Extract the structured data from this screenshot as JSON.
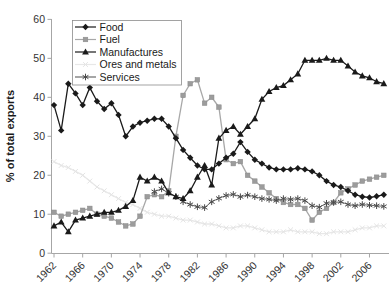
{
  "chart_data": {
    "type": "line",
    "title": "",
    "xlabel": "",
    "ylabel": "% of total exports",
    "ylim": [
      0,
      60
    ],
    "ytick_step": 10,
    "y_ticks": [
      0,
      10,
      20,
      30,
      40,
      50,
      60
    ],
    "x_years": [
      1962,
      1963,
      1964,
      1965,
      1966,
      1967,
      1968,
      1969,
      1970,
      1971,
      1972,
      1973,
      1974,
      1975,
      1976,
      1977,
      1978,
      1979,
      1980,
      1981,
      1982,
      1983,
      1984,
      1985,
      1986,
      1987,
      1988,
      1989,
      1990,
      1991,
      1992,
      1993,
      1994,
      1995,
      1996,
      1997,
      1998,
      1999,
      2000,
      2001,
      2002,
      2003,
      2004,
      2005,
      2006,
      2007,
      2008
    ],
    "xtick_years": [
      1962,
      1966,
      1970,
      1974,
      1978,
      1982,
      1986,
      1990,
      1994,
      1998,
      2002,
      2006
    ],
    "grid": false,
    "legend_position": "top-left-inside",
    "axis_color": "#a6a6a6",
    "label_color": "#333333",
    "series": [
      {
        "name": "Food",
        "marker": "diamond",
        "color": "#1a1a1a",
        "line_color": "#1a1a1a",
        "values": [
          38,
          31.5,
          43.5,
          41,
          38,
          42.5,
          39,
          37,
          38.5,
          35.5,
          30,
          32.5,
          33.5,
          34,
          34.5,
          34.5,
          32.5,
          29.5,
          26.5,
          24.5,
          22.5,
          21.5,
          21.5,
          23,
          24.5,
          25.5,
          28.5,
          26,
          24,
          23,
          22,
          21.5,
          21.5,
          21.5,
          21.8,
          21.5,
          21,
          20,
          18.5,
          17.5,
          17,
          16,
          15,
          14.5,
          14.3,
          14.6,
          15
        ]
      },
      {
        "name": "Fuel",
        "marker": "square",
        "color": "#9c9c9c",
        "line_color": "#a8a8a8",
        "values": [
          10.5,
          9.5,
          10,
          10.5,
          11,
          11.5,
          10,
          9.5,
          9,
          8,
          7,
          7.5,
          9.5,
          14.5,
          15,
          14.5,
          16,
          30,
          40.5,
          43.5,
          44.5,
          38.5,
          40,
          37.5,
          24,
          23,
          23.5,
          20,
          18.5,
          17,
          15.5,
          14,
          13,
          12.5,
          12.5,
          11.5,
          8.5,
          10.5,
          11.5,
          13,
          15.5,
          16.5,
          17.5,
          18.5,
          19,
          19.5,
          20
        ]
      },
      {
        "name": "Manufactures",
        "marker": "triangle",
        "color": "#1a1a1a",
        "line_color": "#1a1a1a",
        "values": [
          7,
          8,
          5.5,
          8.5,
          9,
          9.5,
          10,
          10.5,
          10.5,
          11,
          12,
          13.5,
          19.5,
          18.5,
          19.5,
          18.5,
          15.5,
          14.5,
          14,
          16,
          19.5,
          22.5,
          17.5,
          29.5,
          31.5,
          32.5,
          30.5,
          32.5,
          34.5,
          39.5,
          41.5,
          42.5,
          43,
          44.5,
          46,
          49.5,
          49.5,
          49.5,
          50,
          49.5,
          49.5,
          48,
          46.5,
          45.5,
          45,
          44,
          43.5
        ]
      },
      {
        "name": "Ores and metals",
        "marker": "x",
        "color": "#e4e4e4",
        "line_color": "#e8e8e8",
        "values": [
          23.5,
          22.5,
          22,
          21,
          20,
          18.5,
          17,
          16,
          15,
          14,
          13,
          12.5,
          11.5,
          10.5,
          10,
          9.5,
          9.5,
          9,
          8.5,
          8.5,
          8,
          7.5,
          7.5,
          7,
          6.5,
          6.5,
          7,
          7,
          6.5,
          6,
          5.5,
          5.5,
          5.5,
          6,
          5.5,
          5.5,
          5.5,
          5,
          5,
          5.5,
          5.5,
          5.5,
          6,
          6.5,
          6.5,
          7,
          7
        ]
      },
      {
        "name": "Services",
        "marker": "asterisk",
        "color": "#4a4a4a",
        "line_color": "#6b6b6b",
        "values": [
          null,
          null,
          null,
          null,
          null,
          null,
          null,
          null,
          null,
          null,
          null,
          null,
          null,
          null,
          15.8,
          16.5,
          15.4,
          14.5,
          13.2,
          12.5,
          11.9,
          11.7,
          13.2,
          14.1,
          14.8,
          15.1,
          14.5,
          14.9,
          14.5,
          14,
          13.8,
          13.5,
          14,
          13.8,
          14,
          13.5,
          12.2,
          11.8,
          12.8,
          13,
          13.2,
          12.5,
          12.2,
          12.5,
          12.3,
          12.2,
          12
        ]
      }
    ]
  }
}
